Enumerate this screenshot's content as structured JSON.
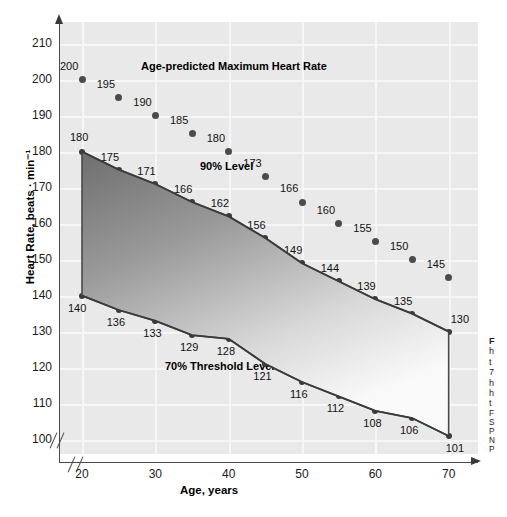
{
  "chart_data": {
    "type": "scatter",
    "title": "",
    "xlabel": "Age, years",
    "ylabel": "Heart Rate, beats · min⁻¹",
    "xlim": [
      17,
      74
    ],
    "ylim": [
      96,
      216
    ],
    "xticks": [
      20,
      30,
      40,
      50,
      60,
      70
    ],
    "yticks": [
      100,
      110,
      120,
      130,
      140,
      150,
      160,
      170,
      180,
      190,
      200,
      210
    ],
    "grid": true,
    "legend": "none",
    "axis_break_x": true,
    "axis_break_y": true,
    "x": [
      20,
      25,
      30,
      35,
      40,
      45,
      50,
      55,
      60,
      65,
      70
    ],
    "series": [
      {
        "name": "Age-predicted Maximum Heart Rate",
        "style": "scatter",
        "values": [
          200,
          195,
          190,
          185,
          180,
          173,
          166,
          160,
          155,
          150,
          145
        ]
      },
      {
        "name": "90% Level",
        "style": "line-markers",
        "values": [
          180,
          175,
          171,
          166,
          162,
          156,
          149,
          144,
          139,
          135,
          130
        ]
      },
      {
        "name": "70% Threshold Level",
        "style": "line-markers",
        "values": [
          140,
          136,
          133,
          129,
          128,
          121,
          116,
          112,
          108,
          106,
          101
        ]
      }
    ],
    "shaded_region": {
      "label": "Training-sensitive Zone",
      "upper_series": "90% Level",
      "lower_series": "70% Threshold Level"
    },
    "annotations": [
      {
        "text": "Age-predicted Maximum Heart Rate",
        "x_px": 141,
        "y_px": 60
      },
      {
        "text": "90% Level",
        "x_px": 200,
        "y_px": 160
      },
      {
        "text": "Training-sensitive Zone",
        "x_px": 208,
        "y_px": 281
      },
      {
        "text": "70% Threshold Level",
        "x_px": 165,
        "y_px": 360
      }
    ],
    "colors": {
      "panel_bg": "#e9e9e9",
      "gridline": "#f6f6f6",
      "marker": "#4b4b4b",
      "line": "#3a3a3a",
      "zone_top": "#6e6e6e",
      "zone_bottom": "#fafafa",
      "axis": "#4a4a4a",
      "text": "#111111"
    }
  },
  "caption": {
    "heading": "F",
    "lines": [
      "h",
      "t",
      "7",
      "h",
      "h",
      "t"
    ],
    "source_lines": [
      "F",
      "S",
      "P",
      "N",
      "P"
    ]
  }
}
